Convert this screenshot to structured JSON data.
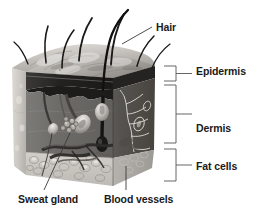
{
  "diagram": {
    "labels": {
      "hair": "Hair",
      "epidermis": "Epidermis",
      "dermis": "Dermis",
      "fat_cells": "Fat cells",
      "sweat_gland": "Sweat gland",
      "blood_vessels": "Blood vessels"
    },
    "colors": {
      "background": "#ffffff",
      "text": "#1a1a1a",
      "leader_line": "#3a3a3a",
      "bracket": "#555555",
      "skin_surface_light": "#d8d6d2",
      "skin_surface_mid": "#a9a6a1",
      "epidermis_band": "#262626",
      "dermis": "#6e6c6a",
      "dermis_right": "#56534f",
      "fat_layer": "#c9c6c1",
      "left_face": "#cbc8c3",
      "hair_shaft": "#1c1c1c",
      "vessel_light": "#e4e2de"
    },
    "structures": [
      {
        "name": "hair-shafts",
        "count": 6
      },
      {
        "name": "hair-follicles",
        "count": 3
      },
      {
        "name": "sweat-gland",
        "count": 1
      },
      {
        "name": "blood-vessels",
        "count": 1
      },
      {
        "name": "nerve-network",
        "count": 1
      },
      {
        "name": "fat-cell-cluster",
        "count": 1
      }
    ],
    "brackets": [
      {
        "name": "epidermis",
        "top": 66,
        "bottom": 81
      },
      {
        "name": "dermis",
        "top": 85,
        "bottom": 143
      },
      {
        "name": "fat_cells",
        "top": 149,
        "bottom": 181
      }
    ]
  }
}
